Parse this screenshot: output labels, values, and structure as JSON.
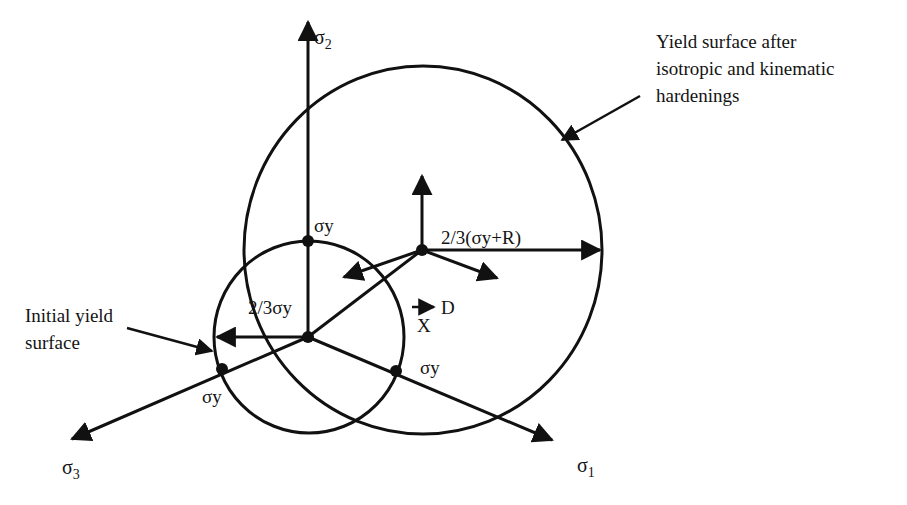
{
  "diagram": {
    "type": "yield-surface-hardening",
    "axes": {
      "sigma2": {
        "symbol": "σ",
        "sub": "2"
      },
      "sigma1": {
        "symbol": "σ",
        "sub": "1"
      },
      "sigma3": {
        "symbol": "σ",
        "sub": "3"
      }
    },
    "labels": {
      "yield_after_line1": "Yield surface after",
      "yield_after_line2": "isotropic and kinematic",
      "yield_after_line3": "hardenings",
      "initial_line1": "Initial yield",
      "initial_line2": "surface",
      "sigma_y_top": "σy",
      "sigma_y_left": "σy",
      "sigma_y_right": "σy",
      "radius_initial": "2/3σy",
      "radius_hardened": "2/3(σy+R)",
      "direction_d": "D",
      "backstress_x": "X"
    },
    "colors": {
      "stroke": "#111111",
      "background": "#ffffff"
    }
  }
}
